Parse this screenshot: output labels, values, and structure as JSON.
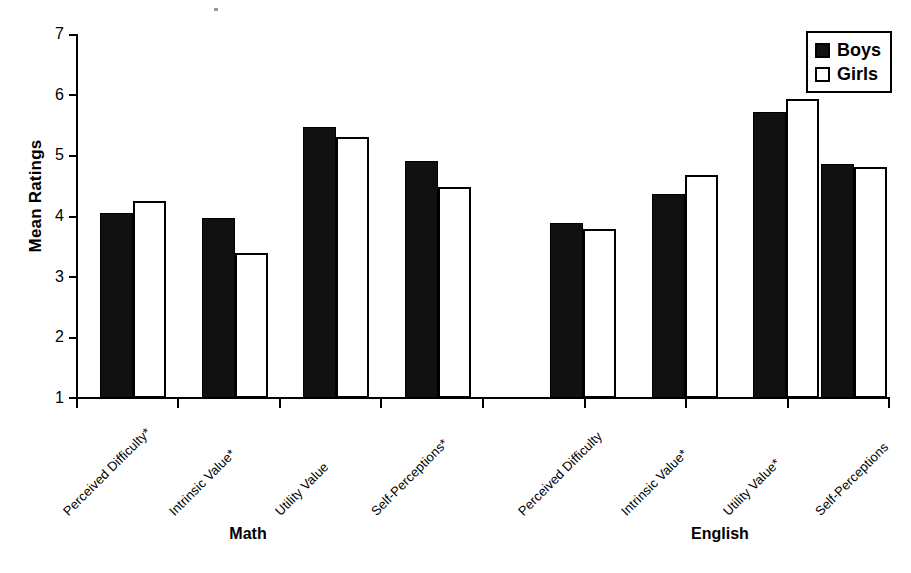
{
  "chart_data": {
    "type": "bar",
    "title": "",
    "xlabel": "",
    "ylabel": "Mean Ratings",
    "ylim": [
      1,
      7
    ],
    "yticks": [
      1,
      2,
      3,
      4,
      5,
      6,
      7
    ],
    "grid": false,
    "legend_position": "top-right",
    "groups": [
      "Math",
      "English"
    ],
    "categories": [
      "Perceived Difficulty*",
      "Intrinsic Value*",
      "Utility Value",
      "Self-Perceptions*",
      "Perceived Difficulty",
      "Intrinsic Value*",
      "Utility Value*",
      "Self-Perceptions"
    ],
    "series": [
      {
        "name": "Boys",
        "color": "#111111",
        "values": [
          4.05,
          3.97,
          5.47,
          4.91,
          3.89,
          4.36,
          5.72,
          4.85
        ]
      },
      {
        "name": "Girls",
        "color": "#ffffff",
        "values": [
          4.25,
          3.39,
          5.31,
          4.48,
          3.78,
          4.67,
          5.93,
          4.8
        ]
      }
    ]
  },
  "axis": {
    "ytick_labels": [
      "7",
      "6",
      "5",
      "4",
      "3",
      "2",
      "1"
    ],
    "ylabel": "Mean Ratings"
  },
  "legend": {
    "items": [
      {
        "label": "Boys",
        "swatch": "filled-square-icon"
      },
      {
        "label": "Girls",
        "swatch": "hollow-square-icon"
      }
    ]
  },
  "groups": [
    {
      "label": "Math"
    },
    {
      "label": "English"
    }
  ],
  "categories": [
    {
      "label": "Perceived Difficulty*"
    },
    {
      "label": "Intrinsic Value*"
    },
    {
      "label": "Utility Value"
    },
    {
      "label": "Self-Perceptions*"
    },
    {
      "label": "Perceived Difficulty"
    },
    {
      "label": "Intrinsic Value*"
    },
    {
      "label": "Utility Value*"
    },
    {
      "label": "Self-Perceptions"
    }
  ]
}
